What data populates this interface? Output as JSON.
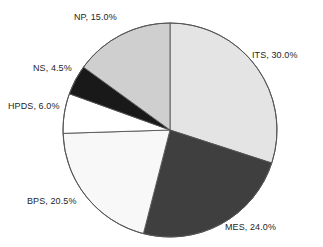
{
  "chart_data": {
    "type": "pie",
    "title": "",
    "subtitle": "",
    "xlabel": "",
    "ylabel": "",
    "legend_position": "none",
    "grid": false,
    "start_angle_deg": 0,
    "direction": "clockwise",
    "units": "percent",
    "total": 100.0,
    "categories": [
      "ITS",
      "MES",
      "BPS",
      "HPDS",
      "NS",
      "NP"
    ],
    "values": [
      30.0,
      24.0,
      20.5,
      6.0,
      4.5,
      15.0
    ],
    "slices": [
      {
        "name": "ITS",
        "value": 30.0,
        "label": "ITS, 30.0%",
        "color": "#e4e4e4"
      },
      {
        "name": "MES",
        "value": 24.0,
        "label": "MES, 24.0%",
        "color": "#3f3f3f"
      },
      {
        "name": "BPS",
        "value": 20.5,
        "label": "BPS, 20.5%",
        "color": "#f8f8f8"
      },
      {
        "name": "HPDS",
        "value": 6.0,
        "label": "HPDS, 6.0%",
        "color": "#ffffff"
      },
      {
        "name": "NS",
        "value": 4.5,
        "label": "NS, 4.5%",
        "color": "#191919"
      },
      {
        "name": "NP",
        "value": 15.0,
        "label": "NP, 15.0%",
        "color": "#cfcfcf"
      }
    ],
    "annotations": [],
    "geometry": {
      "center_x": 170,
      "center_y": 130,
      "radius": 107,
      "outline_color": "#555555"
    }
  },
  "labels": {
    "its": "ITS, 30.0%",
    "mes": "MES, 24.0%",
    "bps": "BPS, 20.5%",
    "hpds": "HPDS, 6.0%",
    "ns": "NS, 4.5%",
    "np": "NP, 15.0%"
  }
}
